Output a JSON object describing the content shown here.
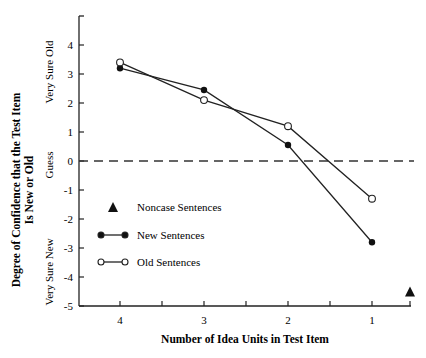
{
  "chart_data": {
    "type": "line",
    "title": "",
    "xlabel": "Number of Idea Units in Test Item",
    "ylabel_line1": "Degree of Confidence that the Test Item",
    "ylabel_line2": "Is New or Old",
    "y_anchors": {
      "top": "Very Sure Old",
      "middle": "Guess",
      "bottom": "Very Sure New"
    },
    "x": [
      4,
      3,
      2,
      1
    ],
    "x_tick_labels": [
      "4",
      "3",
      "2",
      "1"
    ],
    "y_ticks": [
      4,
      3,
      2,
      1,
      0,
      -1,
      -2,
      -3,
      -4,
      -5
    ],
    "y_tick_labels": [
      "4",
      "3",
      "2",
      "1",
      "0",
      "-1",
      "-2",
      "-3",
      "-4",
      "-5"
    ],
    "ylim": [
      -5,
      5
    ],
    "reference_line": {
      "y": 0,
      "style": "dashed"
    },
    "series": [
      {
        "name": "New Sentences",
        "marker": "filled-circle",
        "values": [
          3.2,
          2.45,
          0.55,
          -2.8
        ]
      },
      {
        "name": "Old Sentences",
        "marker": "open-circle",
        "values": [
          3.4,
          2.1,
          1.2,
          -1.3
        ]
      },
      {
        "name": "Noncase Sentences",
        "marker": "filled-triangle",
        "x": [
          0
        ],
        "values": [
          -4.5
        ]
      }
    ],
    "legend": [
      {
        "label": "Noncase Sentences",
        "marker": "filled-triangle"
      },
      {
        "label": "New Sentences",
        "marker": "filled-circle-line"
      },
      {
        "label": "Old Sentences",
        "marker": "open-circle-line"
      }
    ],
    "legend_position": "inside-lower-left",
    "grid": false
  }
}
